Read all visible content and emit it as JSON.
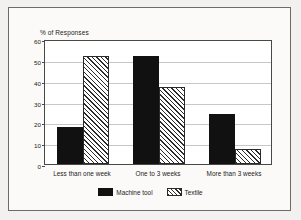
{
  "chart_data": {
    "type": "bar",
    "title": "",
    "subtitle": "",
    "xlabel": "",
    "ylabel": "% of Responses",
    "ylim": [
      0,
      60
    ],
    "yticks": [
      0,
      10,
      20,
      30,
      40,
      50,
      60
    ],
    "ytick_labels": [
      "0",
      "10",
      "20",
      "30",
      "40",
      "50",
      "60"
    ],
    "grid": true,
    "legend_position": "bottom",
    "categories": [
      "Less than one week",
      "One to 3 weeks",
      "More than 3 weeks"
    ],
    "series": [
      {
        "name": "Machine tool",
        "pattern": "solid-black",
        "color": "#111111",
        "values": [
          18,
          52,
          24
        ]
      },
      {
        "name": "Textile",
        "pattern": "diagonal-hatch",
        "color": "#2b2b2b",
        "values": [
          52,
          37,
          7
        ]
      }
    ]
  },
  "legend": {
    "entries": [
      {
        "label": "Machine tool",
        "swatch": "solid-swatch-icon"
      },
      {
        "label": "Textile",
        "swatch": "hatched-swatch-icon"
      }
    ]
  }
}
